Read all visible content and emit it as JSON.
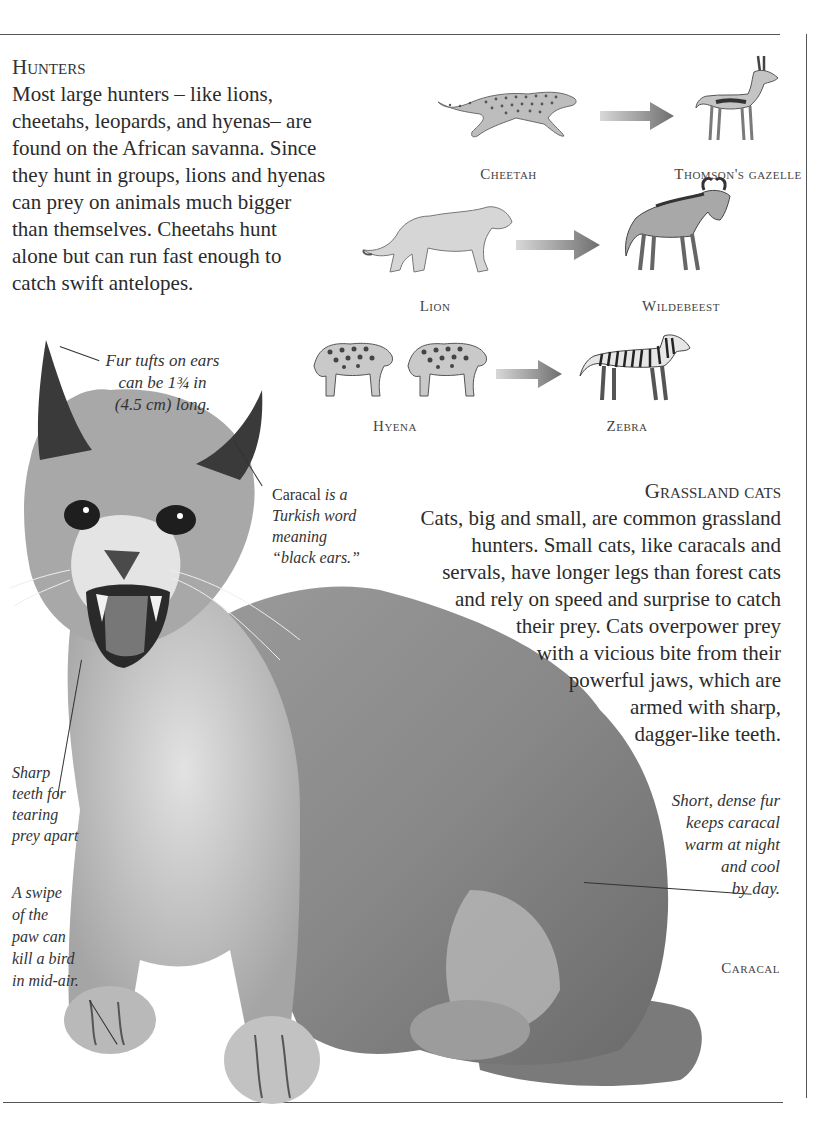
{
  "hunters": {
    "heading": "Hunters",
    "lines": [
      "Most large hunters – like lions,",
      "cheetahs, leopards, and hyenas– are",
      "found on the African savanna. Since",
      "they hunt in groups, lions and hyenas",
      "can prey on animals much bigger",
      "than themselves. Cheetahs hunt",
      "alone but can run fast enough to",
      "catch swift antelopes."
    ]
  },
  "food_chain": [
    {
      "predator": "Cheetah",
      "prey": "Thomson's gazelle"
    },
    {
      "predator": "Lion",
      "prey": "Wildebeest"
    },
    {
      "predator": "Hyena",
      "prey": "Zebra"
    }
  ],
  "grassland": {
    "heading": "Grassland cats",
    "lines": [
      "Cats, big and small, are common grassland",
      "hunters. Small cats, like caracals and",
      "servals, have longer legs than forest cats",
      "and rely on speed and surprise to catch",
      "their prey. Cats overpower prey",
      "with a vicious bite from their",
      "powerful jaws, which are",
      "armed with sharp,",
      "dagger-like teeth."
    ]
  },
  "annotations": {
    "ear_tufts": [
      "Fur tufts on ears",
      "can be 1¾ in",
      "(4.5 cm) long."
    ],
    "name_meaning": {
      "word": "Caracal",
      "rest1": " is a",
      "line2": "Turkish word",
      "line3": "meaning",
      "line4": "“black ears.”"
    },
    "teeth": [
      "Sharp",
      "teeth for",
      "tearing",
      "prey apart"
    ],
    "paw": [
      "A swipe",
      "of the",
      "paw can",
      "kill a bird",
      "in mid-air."
    ],
    "fur": [
      "Short, dense fur",
      "keeps caracal",
      "warm at night",
      "and cool",
      "by day."
    ]
  },
  "main_subject_label": "Caracal",
  "colors": {
    "text": "#2b2b2b",
    "rule": "#555555",
    "arrow": "#7a7a7a",
    "fur_mid": "#8d8d8d",
    "fur_dark": "#5e5e5e",
    "fur_light": "#c9c9c9"
  }
}
